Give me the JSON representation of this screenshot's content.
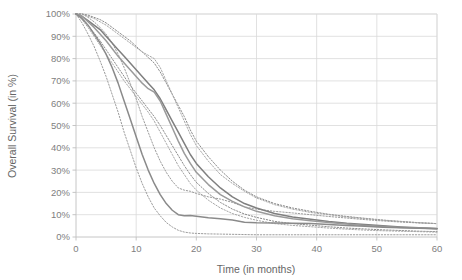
{
  "chart_data": {
    "type": "line",
    "title": "",
    "xlabel": "Time (in months)",
    "ylabel": "Overall Survival (in %)",
    "xlim": [
      0,
      60
    ],
    "ylim": [
      0,
      100
    ],
    "grid": true,
    "legend": "none",
    "xticks": [
      "0",
      "10",
      "20",
      "30",
      "40",
      "50",
      "60"
    ],
    "xtick_values": [
      0,
      10,
      20,
      30,
      40,
      50,
      60
    ],
    "yticks": [
      "0%",
      "10%",
      "20%",
      "30%",
      "40%",
      "50%",
      "60%",
      "70%",
      "80%",
      "90%",
      "100%"
    ],
    "ytick_values": [
      0,
      10,
      20,
      30,
      40,
      50,
      60,
      70,
      80,
      90,
      100
    ],
    "series": [
      {
        "name": "Group 1 (upper survival)",
        "style": "solid",
        "color": "#7f7f7f",
        "x": [
          0,
          1,
          2,
          3,
          4,
          5,
          6,
          7,
          8,
          9,
          10,
          11,
          12,
          13,
          14,
          15,
          16,
          17,
          18,
          19,
          20,
          22,
          24,
          26,
          28,
          30,
          33,
          36,
          39,
          42,
          45,
          48,
          51,
          54,
          57,
          60
        ],
        "values": [
          100,
          99,
          97,
          95,
          93,
          90,
          87,
          84,
          81,
          78,
          75,
          72,
          69,
          66,
          62,
          57,
          52,
          47,
          42,
          37,
          33,
          27,
          22,
          18,
          15,
          13,
          10.5,
          9,
          8,
          7,
          6.2,
          5.6,
          5,
          4.5,
          4.1,
          3.8
        ]
      },
      {
        "name": "Group 1 upper 95% CI",
        "style": "dotted",
        "color": "#8c8c8c",
        "x": [
          0,
          1,
          2,
          3,
          4,
          5,
          6,
          7,
          8,
          9,
          10,
          11,
          12,
          13,
          14,
          15,
          16,
          17,
          18,
          19,
          20,
          22,
          24,
          26,
          28,
          30,
          33,
          36,
          39,
          42,
          45,
          48,
          51,
          54,
          57,
          60
        ],
        "values": [
          100,
          100,
          99.5,
          98.5,
          97.5,
          96,
          94,
          92,
          90,
          88,
          85.5,
          83,
          80.5,
          78,
          74,
          69,
          64,
          59,
          54,
          48,
          43,
          36,
          30,
          25,
          21,
          18,
          15,
          13,
          11.5,
          10.2,
          9.2,
          8.4,
          7.6,
          7,
          6.4,
          6
        ]
      },
      {
        "name": "Group 1 lower 95% CI",
        "style": "dotted",
        "color": "#8c8c8c",
        "x": [
          0,
          1,
          2,
          3,
          4,
          5,
          6,
          7,
          8,
          9,
          10,
          11,
          12,
          13,
          14,
          15,
          16,
          17,
          18,
          19,
          20,
          22,
          24,
          26,
          28,
          30,
          33,
          36,
          39,
          42,
          45,
          48,
          51,
          54,
          57,
          60
        ],
        "values": [
          100,
          98,
          95,
          91.5,
          88,
          84,
          80,
          76,
          72,
          68,
          64.5,
          61,
          57.5,
          54,
          50,
          45.5,
          41,
          36.5,
          32,
          28,
          24.5,
          19.5,
          15.5,
          12.5,
          10.3,
          8.8,
          7,
          6,
          5.3,
          4.6,
          4,
          3.6,
          3.2,
          2.9,
          2.6,
          2.4
        ]
      },
      {
        "name": "Group 2 (middle survival)",
        "style": "solid",
        "color": "#9a9a9a",
        "x": [
          0,
          1,
          2,
          3,
          4,
          5,
          6,
          7,
          8,
          9,
          10,
          11,
          12,
          13,
          14,
          15,
          16,
          17,
          18,
          19,
          20,
          22,
          24,
          26,
          28,
          30,
          33,
          36,
          39,
          42,
          45,
          48,
          51,
          54,
          57,
          60
        ],
        "values": [
          100,
          99,
          96.5,
          94,
          91,
          88,
          84.5,
          81,
          78,
          75,
          72,
          69,
          66.5,
          65,
          61,
          55,
          49,
          43,
          37.5,
          33,
          29,
          23.5,
          19,
          16,
          13.5,
          11.5,
          9.5,
          8.2,
          7.3,
          6.5,
          5.8,
          5.2,
          4.7,
          4.3,
          4,
          3.7
        ]
      },
      {
        "name": "Group 2 upper 95% CI",
        "style": "dotted",
        "color": "#a6a6a6",
        "x": [
          0,
          1,
          2,
          3,
          4,
          5,
          6,
          7,
          8,
          9,
          10,
          11,
          12,
          13,
          14,
          15,
          16,
          17,
          18,
          19,
          20,
          22,
          24,
          26,
          28,
          30,
          33,
          36,
          39,
          42,
          45,
          48,
          51,
          54,
          57,
          60
        ],
        "values": [
          100,
          100,
          99,
          98,
          96.5,
          95,
          93,
          91,
          89,
          87,
          85,
          83,
          81.5,
          80,
          76,
          70,
          64,
          58,
          52,
          46,
          41,
          34,
          28,
          24,
          20.5,
          17.5,
          14.5,
          12.5,
          11,
          10,
          9,
          8.2,
          7.5,
          6.9,
          6.4,
          6
        ]
      },
      {
        "name": "Group 2 lower 95% CI",
        "style": "dotted",
        "color": "#a6a6a6",
        "x": [
          0,
          1,
          2,
          3,
          4,
          5,
          6,
          7,
          8,
          9,
          10,
          11,
          12,
          13,
          14,
          15,
          16,
          17,
          18,
          19,
          20,
          22,
          24,
          26,
          28,
          30,
          33,
          36,
          39,
          42,
          45,
          48,
          51,
          54,
          57,
          60
        ],
        "values": [
          100,
          97.5,
          94,
          90,
          86,
          82,
          78,
          74,
          70,
          66.5,
          63,
          59.5,
          56,
          52,
          47,
          42,
          37,
          32,
          28,
          24,
          21,
          16.5,
          13,
          10.5,
          8.8,
          7.5,
          6,
          5.2,
          4.6,
          4,
          3.5,
          3.1,
          2.8,
          2.6,
          2.4,
          2.2
        ]
      },
      {
        "name": "Group 3 (lower survival)",
        "style": "solid",
        "color": "#8a8a8a",
        "x": [
          0,
          1,
          2,
          3,
          4,
          5,
          6,
          7,
          8,
          9,
          10,
          11,
          12,
          13,
          14,
          15,
          16,
          17,
          18,
          19,
          20,
          22,
          24,
          26,
          28,
          30,
          33,
          36,
          39,
          42,
          45,
          48,
          51,
          54,
          57,
          60
        ],
        "values": [
          100,
          98,
          95,
          91,
          87,
          82,
          76,
          69,
          61,
          53,
          45,
          37,
          30,
          24,
          19,
          15,
          12,
          10,
          9.5,
          9.6,
          9.3,
          8.6,
          8.2,
          7.6,
          6.6,
          6.4,
          6.3,
          6.2,
          6,
          5.6,
          5.2,
          4.8,
          4.4,
          4.1,
          3.9,
          3.7
        ]
      },
      {
        "name": "Group 3 upper 95% CI",
        "style": "dotted",
        "color": "#9c9c9c",
        "x": [
          0,
          1,
          2,
          3,
          4,
          5,
          6,
          7,
          8,
          9,
          10,
          11,
          12,
          13,
          14,
          15,
          16,
          17,
          18,
          19,
          20,
          22,
          24,
          26,
          28,
          30,
          33,
          36,
          39,
          42,
          45,
          48,
          51,
          54,
          57,
          60
        ],
        "values": [
          100,
          100,
          98.5,
          96.5,
          94,
          91,
          87,
          82,
          76,
          69,
          62,
          54,
          47,
          40,
          34,
          29,
          25,
          22,
          21,
          20.5,
          19.5,
          18,
          17,
          15.5,
          13.5,
          12.5,
          11.5,
          10.8,
          10,
          9.2,
          8.5,
          7.8,
          7.2,
          6.7,
          6.3,
          6
        ]
      },
      {
        "name": "Group 3 lower 95% CI",
        "style": "dotted",
        "color": "#9c9c9c",
        "x": [
          0,
          1,
          2,
          3,
          4,
          5,
          6,
          7,
          8,
          9,
          10,
          11,
          12,
          13,
          14,
          15,
          16,
          17,
          18,
          19,
          20,
          22,
          24,
          26,
          28,
          30,
          33,
          36,
          39,
          42,
          45,
          48,
          51,
          54,
          57,
          60
        ],
        "values": [
          100,
          96,
          91,
          85.5,
          79,
          72,
          64,
          56,
          47,
          39,
          31,
          24,
          18,
          13,
          9.5,
          6.5,
          4.5,
          3,
          2.2,
          1.8,
          1.6,
          1.4,
          1.3,
          1.2,
          1.1,
          1,
          1,
          1,
          1,
          1,
          1,
          1,
          1,
          1,
          1,
          1
        ]
      }
    ]
  },
  "style": {
    "gridline_color": "#d9d9d9",
    "axis_color": "#bfbfbf",
    "tick_label_color": "#808080",
    "axis_title_color": "#666666",
    "background": "#ffffff"
  }
}
